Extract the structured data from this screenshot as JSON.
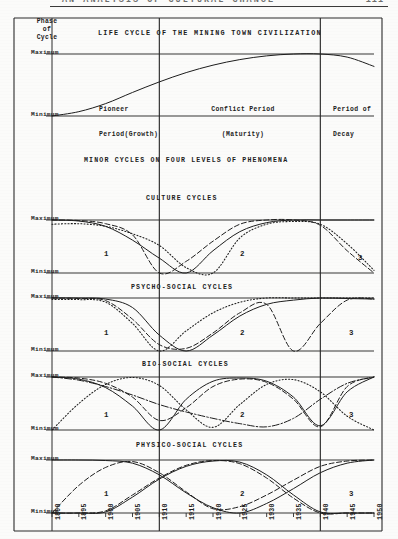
{
  "running_head": {
    "text": "AN ANALYSIS OF CULTURAL CHANGE",
    "page_number": "111"
  },
  "figure": {
    "main_title": "LIFE CYCLE OF THE MINING TOWN CIVILIZATION",
    "section_title": "MINOR CYCLES ON FOUR LEVELS OF PHENOMENA",
    "y_axis_title_line1": "Phase",
    "y_axis_title_line2": "of",
    "y_axis_title_line3": "Cycle",
    "axis_max_label": "Maximum",
    "axis_min_label": "Minimum",
    "periods": [
      {
        "line1": "Pioneer",
        "line2": "Period(Growth)"
      },
      {
        "line1": "Conflict Period",
        "line2": "(Maturity)"
      },
      {
        "line1": "Period of",
        "line2": "Decay"
      }
    ],
    "cycle_numbers": [
      "1",
      "2",
      "3"
    ],
    "panels": [
      {
        "title": "CULTURE CYCLES"
      },
      {
        "title": "PSYCHO-SOCIAL CYCLES"
      },
      {
        "title": "BIO-SOCIAL CYCLES"
      },
      {
        "title": "PHYSICO-SOCIAL CYCLES"
      }
    ],
    "x_tick_labels": [
      "1890",
      "1895",
      "1900",
      "1905",
      "1910",
      "1915",
      "1920",
      "1925",
      "1930",
      "1935",
      "1940",
      "1945",
      "1950"
    ]
  },
  "chart_data": {
    "type": "line",
    "title": "LIFE CYCLE OF THE MINING TOWN CIVILIZATION",
    "subtitle": "MINOR CYCLES ON FOUR LEVELS OF PHENOMENA",
    "xlabel": "",
    "ylabel": "Phase of Cycle",
    "x": [
      1890,
      1895,
      1900,
      1905,
      1910,
      1915,
      1920,
      1925,
      1930,
      1935,
      1940,
      1945,
      1950
    ],
    "xlim": [
      1890,
      1950
    ],
    "ylim": [
      0,
      1
    ],
    "ytick_labels": [
      "Minimum",
      "Maximum"
    ],
    "ytick_values": [
      0,
      1
    ],
    "grid": true,
    "legend": "none",
    "period_boundaries": [
      1910,
      1940
    ],
    "panels": [
      {
        "name": "MACRO LIFE CYCLE",
        "series": [
          {
            "name": "civilization-life-cycle",
            "style": "solid",
            "x": [
              1890,
              1895,
              1900,
              1905,
              1910,
              1915,
              1920,
              1925,
              1930,
              1935,
              1940,
              1945,
              1950
            ],
            "values": [
              0.0,
              0.07,
              0.2,
              0.38,
              0.55,
              0.7,
              0.82,
              0.91,
              0.97,
              1.0,
              1.0,
              0.95,
              0.8
            ]
          }
        ]
      },
      {
        "name": "CULTURE CYCLES",
        "series": [
          {
            "name": "culture-solid",
            "style": "solid",
            "x": [
              1890,
              1895,
              1900,
              1905,
              1910,
              1915,
              1920,
              1925,
              1930,
              1935,
              1940,
              1945,
              1950
            ],
            "values": [
              1.0,
              0.98,
              0.88,
              0.62,
              0.28,
              0.0,
              0.42,
              0.78,
              0.95,
              1.0,
              1.0,
              1.0,
              1.0
            ]
          },
          {
            "name": "culture-dashed",
            "style": "dashed",
            "x": [
              1890,
              1895,
              1900,
              1905,
              1910,
              1915,
              1920,
              1925,
              1930,
              1935,
              1940,
              1945,
              1950
            ],
            "values": [
              1.0,
              0.99,
              0.93,
              0.72,
              0.0,
              0.22,
              0.6,
              0.92,
              1.0,
              1.0,
              0.9,
              0.42,
              0.0
            ]
          },
          {
            "name": "culture-dotted",
            "style": "dotted",
            "x": [
              1890,
              1895,
              1900,
              1905,
              1910,
              1915,
              1920,
              1925,
              1930,
              1935,
              1940,
              1945,
              1950
            ],
            "values": [
              0.92,
              0.93,
              0.88,
              0.74,
              0.52,
              0.1,
              0.0,
              0.66,
              0.92,
              0.97,
              0.92,
              0.55,
              0.05
            ]
          }
        ]
      },
      {
        "name": "PSYCHO-SOCIAL CYCLES",
        "series": [
          {
            "name": "psycho-solid",
            "style": "solid",
            "x": [
              1890,
              1895,
              1900,
              1905,
              1910,
              1915,
              1920,
              1925,
              1930,
              1935,
              1940,
              1945,
              1950
            ],
            "values": [
              1.0,
              1.0,
              0.98,
              0.82,
              0.3,
              0.0,
              0.3,
              0.66,
              0.88,
              0.96,
              1.0,
              0.99,
              0.98
            ]
          },
          {
            "name": "psycho-dashed",
            "style": "dashed",
            "x": [
              1890,
              1895,
              1900,
              1905,
              1910,
              1915,
              1920,
              1925,
              1930,
              1935,
              1940,
              1945,
              1950
            ],
            "values": [
              1.0,
              0.99,
              0.95,
              0.6,
              0.12,
              0.05,
              0.34,
              0.72,
              0.88,
              0.0,
              0.52,
              0.96,
              0.98
            ]
          },
          {
            "name": "psycho-dotted",
            "style": "dotted",
            "x": [
              1890,
              1895,
              1900,
              1905,
              1910,
              1915,
              1920,
              1925,
              1930,
              1935,
              1940,
              1945,
              1950
            ],
            "values": [
              0.97,
              0.97,
              0.92,
              0.52,
              0.0,
              0.38,
              0.72,
              0.92,
              1.0,
              1.0,
              1.0,
              1.0,
              1.0
            ]
          }
        ]
      },
      {
        "name": "BIO-SOCIAL CYCLES",
        "series": [
          {
            "name": "bio-solid",
            "style": "solid",
            "x": [
              1890,
              1895,
              1900,
              1905,
              1910,
              1915,
              1920,
              1925,
              1930,
              1935,
              1940,
              1945,
              1950
            ],
            "values": [
              1.0,
              0.96,
              0.8,
              0.45,
              0.0,
              0.58,
              0.92,
              0.98,
              0.92,
              0.62,
              0.08,
              0.72,
              1.0
            ]
          },
          {
            "name": "bio-dashed",
            "style": "dashed",
            "x": [
              1890,
              1895,
              1900,
              1905,
              1910,
              1915,
              1920,
              1925,
              1930,
              1935,
              1940,
              1945,
              1950
            ],
            "values": [
              1.0,
              0.98,
              0.88,
              0.62,
              0.18,
              0.42,
              0.82,
              0.96,
              0.9,
              0.58,
              0.06,
              0.82,
              1.0
            ]
          },
          {
            "name": "bio-dotted",
            "style": "dotted",
            "x": [
              1890,
              1895,
              1900,
              1905,
              1910,
              1915,
              1920,
              1925,
              1930,
              1935,
              1940,
              1945,
              1950
            ],
            "values": [
              0.0,
              0.5,
              0.86,
              0.99,
              0.84,
              0.38,
              0.05,
              0.48,
              0.86,
              0.95,
              0.72,
              0.26,
              0.0
            ]
          },
          {
            "name": "bio-dashdot",
            "style": "dashdot",
            "x": [
              1890,
              1895,
              1900,
              1905,
              1910,
              1915,
              1920,
              1925,
              1930,
              1935,
              1940,
              1945,
              1950
            ],
            "values": [
              1.0,
              0.94,
              0.82,
              0.66,
              0.48,
              0.34,
              0.22,
              0.12,
              0.06,
              0.22,
              0.58,
              0.88,
              1.0
            ]
          }
        ]
      },
      {
        "name": "PHYSICO-SOCIAL CYCLES",
        "series": [
          {
            "name": "physico-solid",
            "style": "solid",
            "x": [
              1890,
              1895,
              1900,
              1905,
              1910,
              1915,
              1920,
              1925,
              1930,
              1935,
              1940,
              1945,
              1950
            ],
            "values": [
              1.0,
              1.0,
              0.99,
              0.94,
              0.72,
              0.38,
              0.1,
              0.0,
              0.18,
              0.46,
              0.76,
              0.94,
              1.0
            ]
          },
          {
            "name": "physico-dashed",
            "style": "dashed",
            "x": [
              1890,
              1895,
              1900,
              1905,
              1910,
              1915,
              1920,
              1925,
              1930,
              1935,
              1940,
              1945,
              1950
            ],
            "values": [
              0.0,
              0.52,
              0.86,
              0.97,
              0.76,
              0.4,
              0.08,
              0.12,
              0.34,
              0.62,
              0.88,
              0.98,
              1.0
            ]
          },
          {
            "name": "physico-solid-2",
            "style": "solid",
            "x": [
              1890,
              1895,
              1900,
              1905,
              1910,
              1915,
              1920,
              1925,
              1930,
              1935,
              1940,
              1945,
              1950
            ],
            "values": [
              0.0,
              0.0,
              0.02,
              0.3,
              0.64,
              0.88,
              0.98,
              0.96,
              0.72,
              0.34,
              0.02,
              0.0,
              0.0
            ]
          },
          {
            "name": "physico-dashed-2",
            "style": "dashed",
            "x": [
              1890,
              1895,
              1900,
              1905,
              1910,
              1915,
              1920,
              1925,
              1930,
              1935,
              1940,
              1945,
              1950
            ],
            "values": [
              0.0,
              0.0,
              0.04,
              0.34,
              0.66,
              0.9,
              0.99,
              0.93,
              0.66,
              0.28,
              0.0,
              0.0,
              0.0
            ]
          }
        ]
      }
    ]
  }
}
